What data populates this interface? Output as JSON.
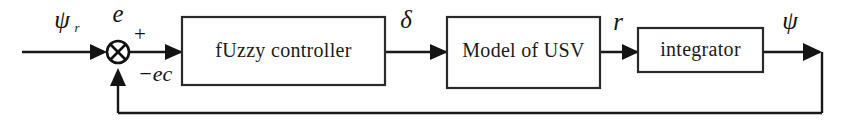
{
  "figure": {
    "type": "control-system-block-diagram",
    "background_color": "#ffffff",
    "line_color": "#181818",
    "text_color": "#141414"
  },
  "blocks": [
    {
      "id": "fuzzy_controller",
      "label": "fUzzy  controller"
    },
    {
      "id": "model_of_usv",
      "label": "Model of USV"
    },
    {
      "id": "integrator",
      "label": "integrator"
    }
  ],
  "summing_junction": {
    "name": "summing-junction",
    "glyph": "cross-circle",
    "plus_sign": "+",
    "minus_sign": "−"
  },
  "signals": {
    "reference": "ψ",
    "reference_subscript": "r",
    "error": "e",
    "error_rate": "ec",
    "error_rate_signed": "−ec",
    "control": "δ",
    "yaw_rate": "r",
    "heading": "ψ"
  }
}
